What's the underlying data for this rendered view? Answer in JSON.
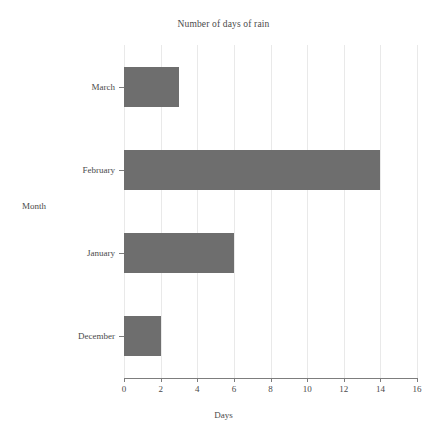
{
  "chart_data": {
    "type": "bar",
    "orientation": "horizontal",
    "title": "Number of days of rain",
    "xlabel": "Days",
    "ylabel": "Month",
    "categories": [
      "March",
      "February",
      "January",
      "December"
    ],
    "values": [
      3,
      14,
      6,
      2
    ],
    "series": [
      {
        "name": "Number of days of rain",
        "values": [
          3,
          14,
          6,
          2
        ]
      }
    ],
    "xlim": [
      0,
      16
    ],
    "xticks": [
      0,
      2,
      4,
      6,
      8,
      10,
      12,
      14,
      16
    ],
    "xtick_labels": [
      "0",
      "2",
      "4",
      "6",
      "8",
      "10",
      "12",
      "14",
      "16"
    ],
    "grid": "vertical",
    "legend": "none",
    "bar_color": "#6e6e6e",
    "background_color": "#ffffff",
    "axis_color": "#7d7d7d",
    "grid_color": "#e9e9e9"
  }
}
